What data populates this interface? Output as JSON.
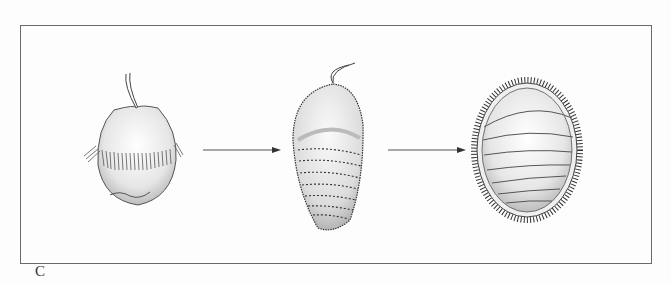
{
  "figure": {
    "panel_label": "C",
    "stages": [
      {
        "name": "trochophore-larva",
        "features": [
          "apical tuft",
          "prototroch ciliary band"
        ]
      },
      {
        "name": "elongating-larva",
        "features": [
          "apical tuft",
          "transverse spicule rows",
          "spiculed margin"
        ]
      },
      {
        "name": "juvenile",
        "features": [
          "eight shell plates",
          "spiny girdle"
        ]
      }
    ],
    "arrows": 2,
    "colors": {
      "line": "#3a3a3a",
      "frame": "#6a6a6a",
      "background": "#fdfdfd",
      "stipple": "#9a9a9a"
    }
  }
}
